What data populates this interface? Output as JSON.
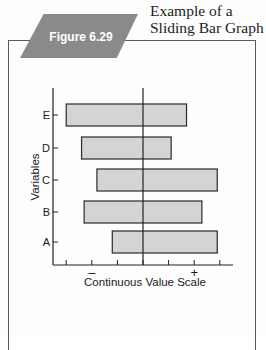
{
  "figure": {
    "label": "Figure 6.29",
    "title_lines": [
      "Example of a",
      "Sliding Bar Graph"
    ]
  },
  "colors": {
    "badge": "#8a8a8a",
    "bar_fill": "#d4d4d4",
    "bar_stroke": "#2a2a2a",
    "axis": "#222222"
  },
  "chart_data": {
    "type": "bar",
    "orientation": "horizontal",
    "subtype": "sliding-bar",
    "title": "Example of a Sliding Bar Graph",
    "xlabel": "Continuous Value Scale",
    "ylabel": "Variables",
    "categories": [
      "A",
      "B",
      "C",
      "D",
      "E"
    ],
    "series": [
      {
        "name": "range",
        "start": [
          -1.2,
          -2.3,
          -1.8,
          -2.4,
          -3.0
        ],
        "end": [
          2.9,
          2.3,
          2.9,
          1.1,
          1.7
        ]
      }
    ],
    "xlim": [
      -3.5,
      3.6
    ],
    "xticks": [
      -3,
      -2,
      -1,
      0,
      1,
      2,
      3
    ],
    "xtick_labels": [
      {
        "value": -2,
        "text": "–"
      },
      {
        "value": 2,
        "text": "+"
      }
    ],
    "reference_line": 0,
    "grid": false,
    "legend": "none"
  }
}
